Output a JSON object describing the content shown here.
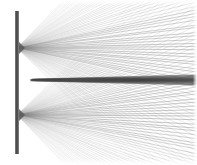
{
  "figure": {
    "width": 197,
    "height": 165,
    "background_color": "#ffffff"
  },
  "colors": {
    "background": "#ffffff",
    "barrier": "#555555",
    "barrier_dark": "#3f3f3f",
    "ray": "#808080",
    "ray_light": "#aaaaaa",
    "caustic": "#4a4a4a",
    "border": "#e8e8e8"
  },
  "barrier": {
    "label": "vertical barrier",
    "x": 15,
    "y_top": 11,
    "y_bottom": 154,
    "thickness": 4,
    "color": "#555555"
  },
  "sources": [
    {
      "label": "upper aperture",
      "x": 17,
      "y": 48,
      "ray_count": 78,
      "angle_min_deg": -46,
      "angle_max_deg": 44,
      "direction": "right"
    },
    {
      "label": "lower aperture",
      "x": 17,
      "y": 115,
      "ray_count": 78,
      "angle_min_deg": -44,
      "angle_max_deg": 46,
      "direction": "right"
    }
  ],
  "caustic_band": {
    "label": "central caustic band",
    "y_center": 80,
    "x_start": 30,
    "x_end": 197,
    "thickness_start": 1,
    "thickness_end": 6,
    "color": "#4a4a4a"
  },
  "chart_data": {
    "type": "line",
    "xlabel": "",
    "ylabel": "",
    "xlim": [
      0,
      197
    ],
    "ylim": [
      165,
      0
    ],
    "grid": false,
    "legend": "none",
    "annotations": [
      "Vertical barrier at x = 15 spanning y = 11 to y = 154",
      "Upper point source at (17, 48)",
      "Lower point source at (17, 115)",
      "Dark horizontal caustic at y = 80 extending from x = 30 to the right edge",
      "Mirror symmetry about the horizontal mid-line y = 81.5"
    ],
    "series": [
      {
        "name": "upper-fan-rays",
        "origin": [
          17,
          48
        ],
        "count": 78,
        "angle_range_deg": [
          -46,
          44
        ]
      },
      {
        "name": "lower-fan-rays",
        "origin": [
          17,
          115
        ],
        "count": 78,
        "angle_range_deg": [
          -44,
          46
        ]
      },
      {
        "name": "caustic",
        "x": [
          30,
          197
        ],
        "values": [
          80,
          80
        ]
      }
    ]
  }
}
